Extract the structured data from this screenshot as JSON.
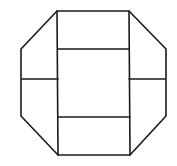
{
  "diagram": {
    "title": "",
    "stroke_color": "#1a1a1a",
    "background": "#ffffff",
    "stroke_width": 1.6,
    "outline": {
      "shape": "octagon",
      "points": [
        [
          57,
          11
        ],
        [
          129,
          11
        ],
        [
          166,
          49
        ],
        [
          166,
          116
        ],
        [
          130,
          155
        ],
        [
          58,
          155
        ],
        [
          21,
          116
        ],
        [
          21,
          49
        ]
      ]
    },
    "segments": [
      {
        "name": "center-left-vertical",
        "x1": 57,
        "y1": 11,
        "x2": 58,
        "y2": 155
      },
      {
        "name": "center-right-vertical",
        "x1": 129,
        "y1": 11,
        "x2": 130,
        "y2": 155
      },
      {
        "name": "center-top-divider",
        "x1": 58,
        "y1": 49,
        "x2": 129,
        "y2": 49
      },
      {
        "name": "center-bottom-divider",
        "x1": 58,
        "y1": 117,
        "x2": 130,
        "y2": 117
      },
      {
        "name": "left-wing-divider",
        "x1": 22,
        "y1": 79,
        "x2": 58,
        "y2": 79
      },
      {
        "name": "right-wing-divider",
        "x1": 129,
        "y1": 79,
        "x2": 165,
        "y2": 79
      }
    ]
  }
}
